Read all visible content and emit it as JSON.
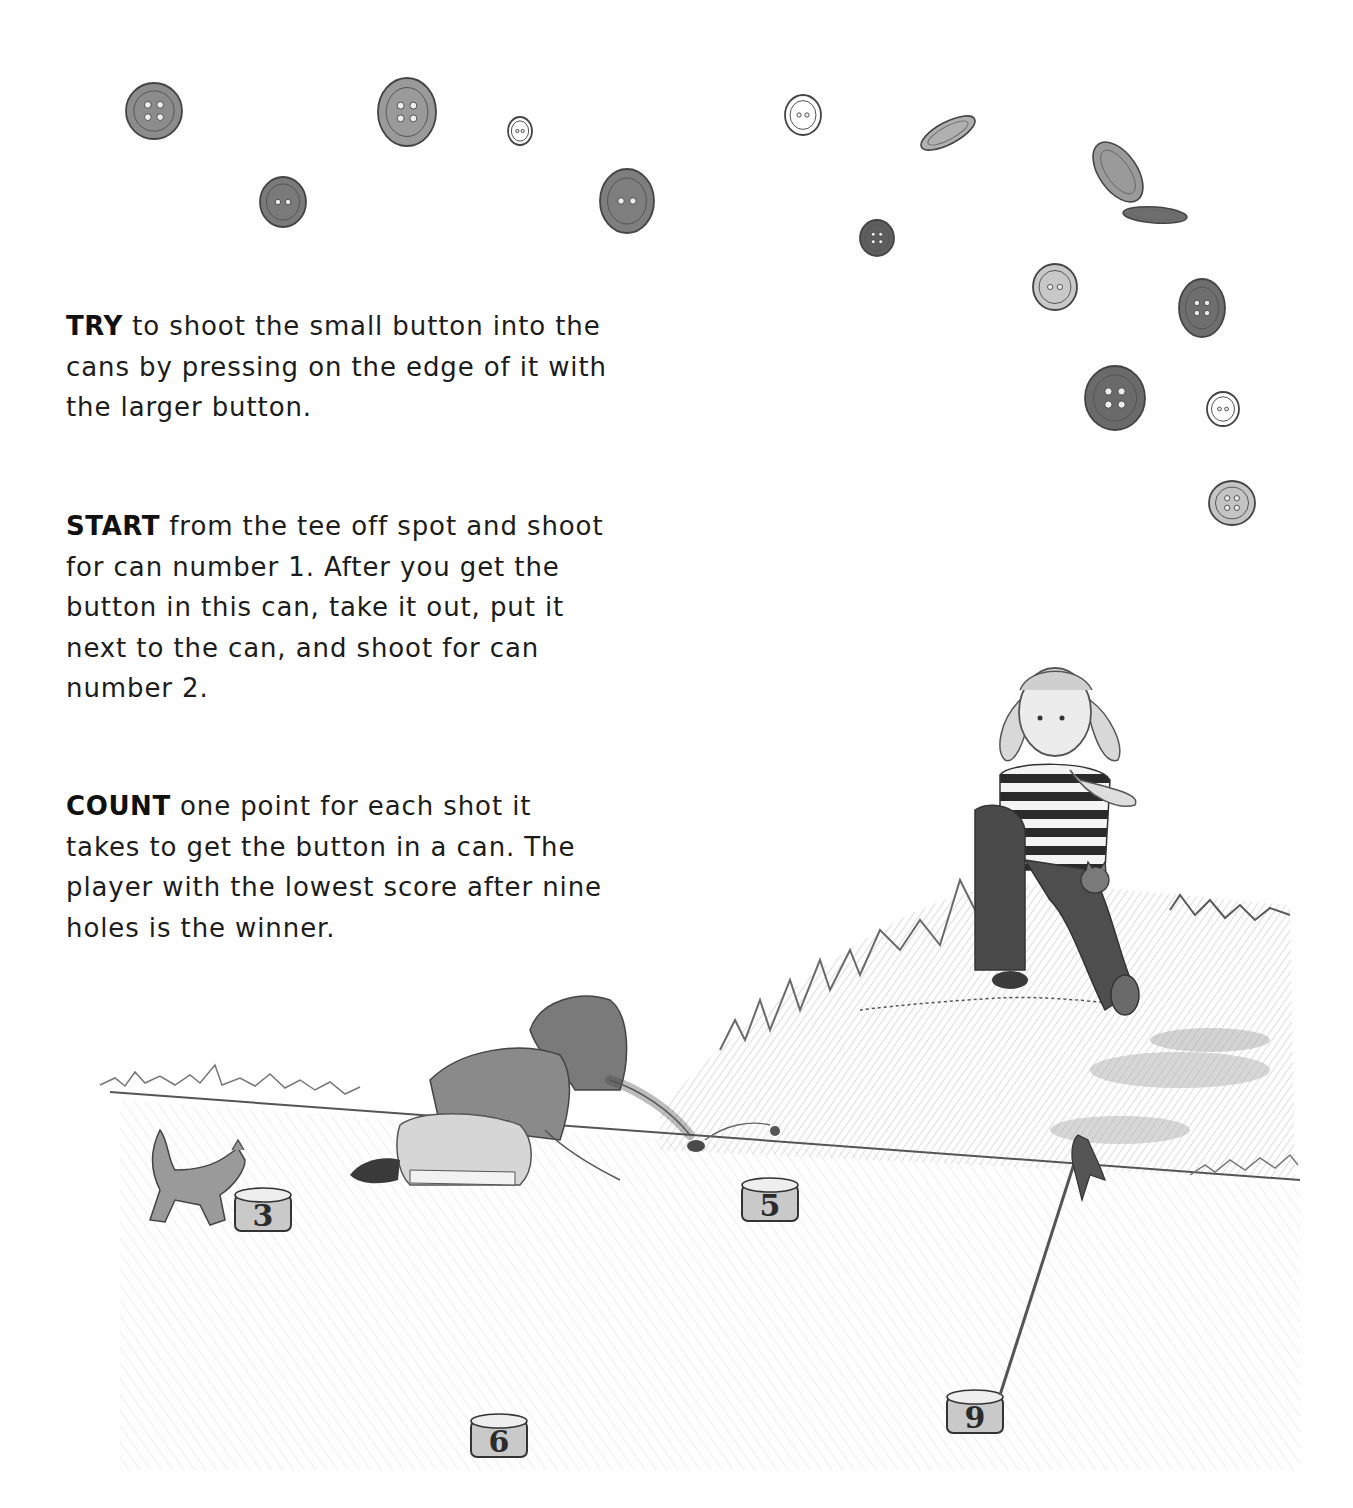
{
  "page": {
    "background": "#fefefe",
    "ink_color": "#1c1c1c",
    "pencil_tone": "#6a6a6a"
  },
  "instructions": [
    {
      "keyword": "TRY",
      "text": " to shoot the small button into the\ncans by pressing on the edge of it with\nthe larger button."
    },
    {
      "keyword": "START",
      "text": " from the tee off spot and shoot\nfor can number 1. After you get the\nbutton in this can, take it out, put it\nnext to the can, and shoot for can\nnumber 2."
    },
    {
      "keyword": "COUNT",
      "text": " one point for each shot it\ntakes to get the button in a can. The\nplayer with the lowest score after nine\nholes is the winner."
    }
  ],
  "illustration": {
    "buttons": [
      {
        "x": 154,
        "y": 111,
        "rx": 28,
        "ry": 28,
        "holes": 4,
        "shade": "#8c8c8c"
      },
      {
        "x": 283,
        "y": 202,
        "rx": 23,
        "ry": 25,
        "holes": 2,
        "shade": "#7a7a7a"
      },
      {
        "x": 407,
        "y": 112,
        "rx": 29,
        "ry": 34,
        "holes": 4,
        "shade": "#9a9a9a"
      },
      {
        "x": 520,
        "y": 131,
        "rx": 12,
        "ry": 14,
        "holes": 2,
        "shade": "#ffffff"
      },
      {
        "x": 627,
        "y": 201,
        "rx": 27,
        "ry": 32,
        "holes": 2,
        "shade": "#7e7e7e"
      },
      {
        "x": 803,
        "y": 115,
        "rx": 18,
        "ry": 20,
        "holes": 2,
        "shade": "#ffffff"
      },
      {
        "x": 877,
        "y": 238,
        "rx": 17,
        "ry": 18,
        "holes": 4,
        "shade": "#5e5e5e"
      },
      {
        "x": 1055,
        "y": 287,
        "rx": 22,
        "ry": 23,
        "holes": 2,
        "shade": "#c8c8c8"
      },
      {
        "x": 1202,
        "y": 308,
        "rx": 23,
        "ry": 29,
        "holes": 4,
        "shade": "#6e6e6e"
      },
      {
        "x": 1115,
        "y": 398,
        "rx": 30,
        "ry": 32,
        "holes": 4,
        "shade": "#6a6a6a"
      },
      {
        "x": 1223,
        "y": 409,
        "rx": 16,
        "ry": 17,
        "holes": 2,
        "shade": "#ffffff"
      },
      {
        "x": 1232,
        "y": 503,
        "rx": 23,
        "ry": 22,
        "holes": 4,
        "shade": "#c4c4c4"
      }
    ],
    "tilted_buttons": [
      {
        "x": 948,
        "y": 133,
        "rx": 30,
        "ry": 11,
        "rotate": -28,
        "shade": "#b0b0b0"
      },
      {
        "x": 1118,
        "y": 172,
        "rx": 34,
        "ry": 19,
        "rotate": 55,
        "shade": "#9a9a9a"
      },
      {
        "x": 1155,
        "y": 215,
        "rx": 32,
        "ry": 8,
        "rotate": 4,
        "shade": "#6e6e6e"
      }
    ],
    "cans": [
      {
        "label": "3",
        "x": 263,
        "y": 1213
      },
      {
        "label": "5",
        "x": 770,
        "y": 1203
      },
      {
        "label": "6",
        "x": 499,
        "y": 1439
      },
      {
        "label": "9",
        "x": 975,
        "y": 1415
      }
    ],
    "flag": {
      "pole_top_x": 1080,
      "pole_top_y": 1140,
      "pole_bottom_x": 1000,
      "pole_bottom_y": 1395
    },
    "characters": [
      "girl-kneeling-shooting-button",
      "girl-sitting-on-hill-striped-shirt",
      "kitten-near-can-3",
      "kitten-in-lap"
    ]
  }
}
